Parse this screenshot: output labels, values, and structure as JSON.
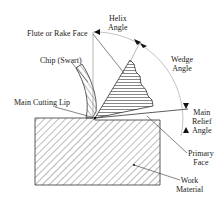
{
  "diagram": {
    "labels": {
      "helix_angle": [
        "Helix",
        "Angle"
      ],
      "flute_or_rake_face": "Flute or Rake Face",
      "wedge_angle": [
        "Wedge",
        "Angle"
      ],
      "chip": "Chip (Swart)",
      "main_cutting_lip": "Main Cutting Lip",
      "main_relief_angle": [
        "Main",
        "Relief",
        "Angle"
      ],
      "primary_face": [
        "Primary",
        "Face"
      ],
      "work_material": [
        "Work",
        "Material"
      ]
    },
    "colors": {
      "line": "#333333",
      "hatch": "#555555",
      "arc": "#888888"
    }
  }
}
